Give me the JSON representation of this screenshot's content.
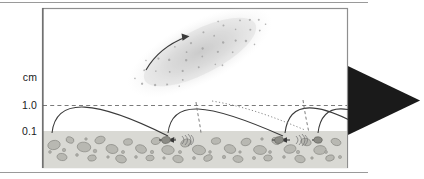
{
  "figure": {
    "kind": "saltation-and-dust-storm-diagram",
    "title_text": null,
    "frame": {
      "left": 42,
      "top": 8,
      "right": 348,
      "bottom": 168
    },
    "background_color": "#ffffff",
    "frame_color": "#8f8f8f",
    "line_color": "#3a3a3a"
  },
  "annotations": {
    "wind_label": "Wind",
    "wind_arrow_icon": "right-arrow-icon",
    "dust_storm_label": "Dust storm",
    "dust_storm_arrow_icon": "curved-arrow-icon"
  },
  "y_axis": {
    "unit_label": "cm",
    "ticks": [
      {
        "label": "1.0",
        "y": 105,
        "style": "dashed"
      },
      {
        "label": "0.1",
        "y": 131,
        "style": "dashed"
      }
    ],
    "axis_line_color": "#5a5a5a",
    "gridline_color": "#6b6b6b"
  },
  "ground": {
    "surface_y": 131,
    "bottom_y": 168,
    "fill_color": "#d9d9d4",
    "grain_color": "#b4b4ae",
    "grain_edge_color": "#8a8a85",
    "grain_count": 64
  },
  "dust_cloud": {
    "center_x": 200,
    "center_y": 52,
    "rotation_deg": -27,
    "radius_x": 78,
    "radius_y": 30,
    "fill_color": "#cfcfcf",
    "speck_color": "#9a9a9a",
    "speck_count": 150
  },
  "trajectories": {
    "description": "Saltating-grain ballistic arcs launching from the bed, rising to the 1.0 cm level and impacting downwind",
    "solid": [
      {
        "x0": 52,
        "y0": 133,
        "cx1": 56,
        "cy1": 96,
        "cx2": 96,
        "cy2": 100,
        "x1": 168,
        "y1": 136
      },
      {
        "x0": 168,
        "y0": 133,
        "cx1": 172,
        "cy1": 99,
        "cx2": 206,
        "cy2": 102,
        "x1": 283,
        "y1": 136
      },
      {
        "x0": 285,
        "y0": 133,
        "cx1": 289,
        "cy1": 99,
        "cx2": 318,
        "cy2": 101,
        "x1": 368,
        "y1": 130
      },
      {
        "x0": 318,
        "y0": 133,
        "cx1": 322,
        "cy1": 100,
        "cx2": 348,
        "cy2": 102,
        "x1": 400,
        "y1": 132
      }
    ],
    "dashed": [
      {
        "x0": 196,
        "y0": 102,
        "cx1": 198,
        "cy1": 116,
        "cx2": 200,
        "cy2": 124,
        "x1": 201,
        "y1": 133
      },
      {
        "x0": 303,
        "y0": 100,
        "cx1": 305,
        "cy1": 114,
        "cx2": 307,
        "cy2": 123,
        "x1": 309,
        "y1": 133
      }
    ],
    "dotted": [
      {
        "x0": 212,
        "y0": 101,
        "cx1": 248,
        "cy1": 107,
        "cx2": 276,
        "cy2": 118,
        "x1": 305,
        "y1": 130
      }
    ]
  },
  "impacts": [
    {
      "x": 166,
      "y": 140,
      "type": "impact-arrow-pair"
    },
    {
      "x": 186,
      "y": 140,
      "type": "splash-burst"
    },
    {
      "x": 279,
      "y": 140,
      "type": "impact-arrow-pair"
    },
    {
      "x": 300,
      "y": 140,
      "type": "splash-burst"
    },
    {
      "x": 318,
      "y": 140,
      "type": "impact-arrow-pair"
    }
  ]
}
